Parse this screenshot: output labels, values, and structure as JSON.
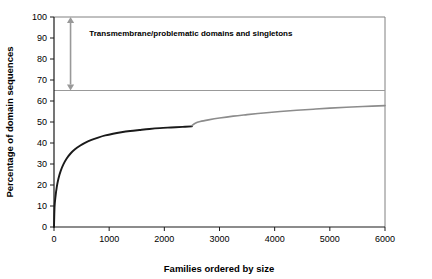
{
  "chart_data": {
    "type": "line",
    "title": "",
    "xlabel": "Families ordered by size",
    "ylabel": "Percentage of domain sequences",
    "xlim": [
      0,
      6000
    ],
    "ylim": [
      0,
      100
    ],
    "xticks": [
      "0",
      "1000",
      "2000",
      "3000",
      "4000",
      "5000",
      "6000"
    ],
    "xtick_values": [
      0,
      1000,
      2000,
      3000,
      4000,
      5000,
      6000
    ],
    "yticks": [
      "0",
      "10",
      "20",
      "30",
      "40",
      "50",
      "60",
      "70",
      "80",
      "90",
      "100"
    ],
    "ytick_values": [
      0,
      10,
      20,
      30,
      40,
      50,
      60,
      70,
      80,
      90,
      100
    ],
    "grid": false,
    "legend": "none",
    "series": [
      {
        "name": "assigned-domain-families",
        "color": "#1a1a1a",
        "style": "solid",
        "width": 1.9,
        "x": [
          0,
          10,
          25,
          50,
          80,
          120,
          170,
          230,
          300,
          380,
          470,
          570,
          680,
          800,
          930,
          1070,
          1220,
          1380,
          1550,
          1730,
          1920,
          2120,
          2330,
          2500
        ],
        "y": [
          0,
          9.5,
          14.0,
          19.0,
          23.0,
          26.6,
          29.8,
          32.6,
          35.0,
          37.0,
          38.7,
          40.2,
          41.5,
          42.6,
          43.6,
          44.4,
          45.1,
          45.7,
          46.2,
          46.7,
          47.1,
          47.4,
          47.7,
          47.9
        ]
      },
      {
        "name": "extrapolated-families",
        "color": "#8c8c8c",
        "style": "solid",
        "width": 1.6,
        "x": [
          2500,
          2560,
          2650,
          2800,
          3000,
          3250,
          3500,
          3800,
          4100,
          4400,
          4700,
          5000,
          5300,
          5600,
          6000
        ],
        "y": [
          48.3,
          49.4,
          50.2,
          51.0,
          51.9,
          52.8,
          53.5,
          54.3,
          55.0,
          55.6,
          56.1,
          56.6,
          57.0,
          57.4,
          57.8
        ]
      }
    ],
    "reference_line": {
      "name": "coverage-ceiling",
      "y": 65,
      "color": "#999999",
      "style": "solid"
    },
    "annotations": [
      {
        "name": "transmembrane-region",
        "text": "Transmembrane/problematic domains and singletons",
        "arrow": {
          "x": 300,
          "y_from": 65,
          "y_to": 100,
          "double_headed": true,
          "color": "#999999"
        },
        "text_x": 640,
        "text_y": 91
      }
    ],
    "plot_frame": {
      "top_border": true,
      "right_border": true,
      "left_axis": true,
      "bottom_axis": true,
      "border_color": "#808080"
    }
  }
}
